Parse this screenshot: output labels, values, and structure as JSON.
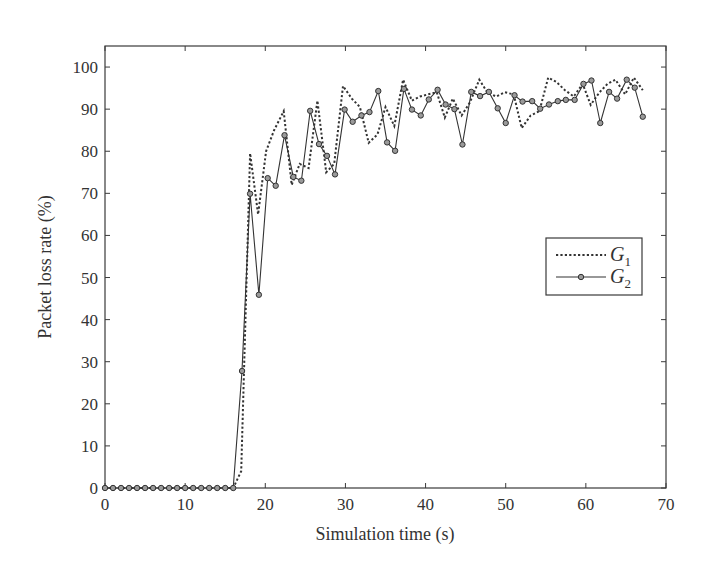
{
  "chart_data": {
    "type": "line",
    "title": "",
    "xlabel": "Simulation time (s)",
    "ylabel": "Packet loss rate (%)",
    "xlim": [
      0,
      70
    ],
    "ylim": [
      0,
      105
    ],
    "xticks": [
      0,
      10,
      20,
      30,
      40,
      50,
      60,
      70
    ],
    "yticks": [
      0,
      10,
      20,
      30,
      40,
      50,
      60,
      70,
      80,
      90,
      100
    ],
    "grid": false,
    "legend_position": "right-center",
    "series": [
      {
        "name": "G1",
        "label_main": "G",
        "label_sub": "1",
        "style": "dotted",
        "marker": "none",
        "color": "#333333",
        "x": [
          0,
          1,
          2,
          3,
          4,
          5,
          6,
          7,
          8,
          9,
          10,
          11,
          12,
          13,
          14,
          15,
          16,
          17,
          18.1,
          19.1,
          20.1,
          21.1,
          22.3,
          23.3,
          24.3,
          25.4,
          26.5,
          27.6,
          28.6,
          29.7,
          30.8,
          31.8,
          32.9,
          34.0,
          35.0,
          36.1,
          37.2,
          38.3,
          39.3,
          40.3,
          41.4,
          42.4,
          43.4,
          44.5,
          45.5,
          46.7,
          47.7,
          48.8,
          49.9,
          51.0,
          52.0,
          53.1,
          54.2,
          55.3,
          56.3,
          57.4,
          58.5,
          59.6,
          60.6,
          61.7,
          62.7,
          63.7,
          64.9,
          66.0,
          67.1
        ],
        "y": [
          0,
          0,
          0,
          0,
          0,
          0,
          0,
          0,
          0,
          0,
          0,
          0,
          0,
          0,
          0,
          0,
          0,
          4,
          79.5,
          65,
          80,
          85,
          89.5,
          72,
          77,
          76,
          92,
          75,
          77,
          95.5,
          92.5,
          90.5,
          82,
          84,
          90.5,
          86,
          97,
          92,
          93,
          93.5,
          94,
          88,
          92.5,
          88.5,
          91.5,
          97,
          94,
          93,
          94,
          93.5,
          85.5,
          88.5,
          89.5,
          97.5,
          96.5,
          94.5,
          93,
          96,
          91,
          94,
          96,
          97,
          93.5,
          97.5,
          94.5
        ]
      },
      {
        "name": "G2",
        "label_main": "G",
        "label_sub": "2",
        "style": "solid",
        "marker": "circle",
        "color": "#333333",
        "x": [
          0,
          1,
          2,
          3,
          4,
          5,
          6,
          7,
          8,
          9,
          10,
          11,
          12,
          13,
          14,
          15,
          16,
          17.1,
          18.1,
          19.2,
          20.3,
          21.3,
          22.4,
          23.5,
          24.5,
          25.6,
          26.7,
          27.7,
          28.7,
          29.9,
          30.9,
          32.0,
          33.0,
          34.1,
          35.2,
          36.2,
          37.3,
          38.3,
          39.4,
          40.4,
          41.5,
          42.5,
          43.6,
          44.6,
          45.7,
          46.8,
          47.9,
          49.0,
          50.0,
          51.1,
          52.1,
          53.3,
          54.3,
          55.4,
          56.5,
          57.5,
          58.6,
          59.7,
          60.7,
          61.8,
          62.9,
          63.9,
          65.1,
          66.1,
          67.1
        ],
        "y": [
          0,
          0,
          0,
          0,
          0,
          0,
          0,
          0,
          0,
          0,
          0,
          0,
          0,
          0,
          0,
          0,
          0,
          27.8,
          69.9,
          45.9,
          73.6,
          71.8,
          83.8,
          73.9,
          73.0,
          89.6,
          81.7,
          78.9,
          74.5,
          89.9,
          87.0,
          88.5,
          89.3,
          94.3,
          82.1,
          80.1,
          94.8,
          89.9,
          88.5,
          92.3,
          94.6,
          91.1,
          90.0,
          81.6,
          94.1,
          93.1,
          94.1,
          90.2,
          86.7,
          93.3,
          91.8,
          91.9,
          90.1,
          91.1,
          91.9,
          92.2,
          92.2,
          96.0,
          96.8,
          86.7,
          94.1,
          92.5,
          97.0,
          95.1,
          88.2
        ]
      }
    ]
  },
  "layout": {
    "plot_left": 105,
    "plot_right": 666,
    "plot_top": 46,
    "plot_bottom": 488,
    "legend": {
      "x": 546,
      "y": 238,
      "w": 96,
      "h": 57
    }
  }
}
